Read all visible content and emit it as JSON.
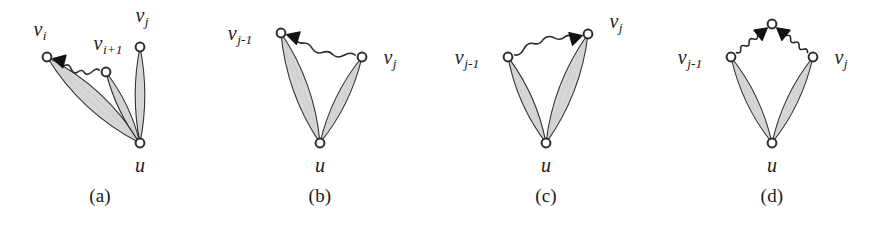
{
  "figure": {
    "type": "diagram",
    "width": 880,
    "height": 225,
    "background_color": "#ffffff",
    "stroke_color": "#2b2b2b",
    "lens_fill_color": "#d6d6d6",
    "vertex_fill_color": "#ffffff",
    "arrow_color": "#111111"
  },
  "panels": [
    {
      "id": "a",
      "caption": "(a)",
      "caption_x": 100,
      "vertices": [
        {
          "name": "v_i",
          "label": "v",
          "sub": "i",
          "x": 47,
          "y": 57,
          "label_x": 40,
          "label_y": 36,
          "label_anchor": "middle"
        },
        {
          "name": "v_i+1",
          "label": "v",
          "sub": "i+1",
          "x": 106,
          "y": 72,
          "label_x": 108,
          "label_y": 50,
          "label_anchor": "middle"
        },
        {
          "name": "v_j",
          "label": "v",
          "sub": "j",
          "x": 140,
          "y": 47,
          "label_x": 142,
          "label_y": 22,
          "label_anchor": "middle"
        },
        {
          "name": "u",
          "label": "u",
          "sub": "",
          "x": 140,
          "y": 143,
          "label_x": 140,
          "label_y": 172,
          "label_anchor": "middle"
        }
      ],
      "bundles": [
        {
          "from": "v_i",
          "to": "u",
          "count": 3,
          "spread": 13
        },
        {
          "from": "v_i+1",
          "to": "u",
          "count": 2,
          "spread": 6
        },
        {
          "from": "v_j",
          "to": "u",
          "count": 2,
          "spread": 7
        }
      ],
      "wavy_edges": [
        {
          "from": "v_i+1",
          "to": "v_i",
          "arrow_at": "v_i",
          "arrow_dir": "left"
        }
      ]
    },
    {
      "id": "b",
      "caption": "(b)",
      "caption_x": 320,
      "vertices": [
        {
          "name": "v_j-1",
          "label": "v",
          "sub": "j-1",
          "x": 281,
          "y": 33,
          "label_x": 240,
          "label_y": 40,
          "label_anchor": "middle"
        },
        {
          "name": "v_j",
          "label": "v",
          "sub": "j",
          "x": 362,
          "y": 57,
          "label_x": 390,
          "label_y": 64,
          "label_anchor": "middle"
        },
        {
          "name": "u",
          "label": "u",
          "sub": "",
          "x": 320,
          "y": 143,
          "label_x": 320,
          "label_y": 172,
          "label_anchor": "middle"
        }
      ],
      "bundles": [
        {
          "from": "v_j-1",
          "to": "u",
          "count": 3,
          "spread": 11
        },
        {
          "from": "v_j",
          "to": "u",
          "count": 2,
          "spread": 8
        }
      ],
      "wavy_edges": [
        {
          "from": "v_j",
          "to": "v_j-1",
          "arrow_at": "v_j-1",
          "arrow_dir": "left"
        }
      ]
    },
    {
      "id": "c",
      "caption": "(c)",
      "caption_x": 546,
      "vertices": [
        {
          "name": "v_j-1",
          "label": "v",
          "sub": "j-1",
          "x": 508,
          "y": 57,
          "label_x": 467,
          "label_y": 64,
          "label_anchor": "middle"
        },
        {
          "name": "v_j",
          "label": "v",
          "sub": "j",
          "x": 588,
          "y": 34,
          "label_x": 616,
          "label_y": 28,
          "label_anchor": "middle"
        },
        {
          "name": "u",
          "label": "u",
          "sub": "",
          "x": 546,
          "y": 143,
          "label_x": 546,
          "label_y": 172,
          "label_anchor": "middle"
        }
      ],
      "bundles": [
        {
          "from": "v_j-1",
          "to": "u",
          "count": 2,
          "spread": 8
        },
        {
          "from": "v_j",
          "to": "u",
          "count": 3,
          "spread": 11
        }
      ],
      "wavy_edges": [
        {
          "from": "v_j-1",
          "to": "v_j",
          "arrow_at": "v_j",
          "arrow_dir": "right"
        }
      ]
    },
    {
      "id": "d",
      "caption": "(d)",
      "caption_x": 772,
      "vertices": [
        {
          "name": "top",
          "label": "",
          "sub": "",
          "x": 772,
          "y": 24,
          "label_x": 0,
          "label_y": 0,
          "label_anchor": "middle"
        },
        {
          "name": "v_j-1",
          "label": "v",
          "sub": "j-1",
          "x": 731,
          "y": 57,
          "label_x": 690,
          "label_y": 64,
          "label_anchor": "middle"
        },
        {
          "name": "v_j",
          "label": "v",
          "sub": "j",
          "x": 813,
          "y": 57,
          "label_x": 841,
          "label_y": 64,
          "label_anchor": "middle"
        },
        {
          "name": "u",
          "label": "u",
          "sub": "",
          "x": 772,
          "y": 143,
          "label_x": 772,
          "label_y": 172,
          "label_anchor": "middle"
        }
      ],
      "bundles": [
        {
          "from": "v_j-1",
          "to": "u",
          "count": 2,
          "spread": 8
        },
        {
          "from": "v_j",
          "to": "u",
          "count": 2,
          "spread": 8
        }
      ],
      "wavy_edges": [
        {
          "from": "v_j-1",
          "to": "top",
          "arrow_at": "top",
          "arrow_dir": "up-right"
        },
        {
          "from": "v_j",
          "to": "top",
          "arrow_at": "top",
          "arrow_dir": "up-left"
        }
      ]
    }
  ]
}
